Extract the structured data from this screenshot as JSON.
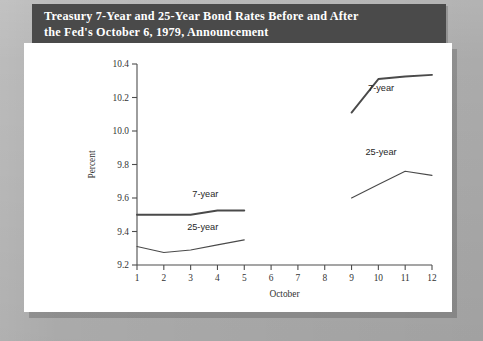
{
  "title": {
    "line1": "Treasury 7-Year and 25-Year Bond Rates Before and After",
    "line2": "the Fed's October 6, 1979, Announcement"
  },
  "colors": {
    "page_background": "#b4b4b4",
    "title_bar": "#4a4a4a",
    "title_text": "#ffffff",
    "panel": "#ffffff",
    "line": "#4a4a4a",
    "axis": "#4d4d4d"
  },
  "chart_data": {
    "type": "line",
    "title": "Treasury 7-Year and 25-Year Bond Rates Before and After the Fed's October 6, 1979, Announcement",
    "xlabel": "October",
    "ylabel": "Percent",
    "xlim": [
      1,
      12
    ],
    "ylim": [
      9.2,
      10.4
    ],
    "xticks": [
      1,
      2,
      3,
      4,
      5,
      6,
      7,
      8,
      9,
      10,
      11,
      12
    ],
    "xticklabels": [
      "1",
      "2",
      "3",
      "4",
      "5",
      "6",
      "7",
      "8",
      "9",
      "10",
      "11",
      "12"
    ],
    "yticks": [
      9.2,
      9.4,
      9.6,
      9.8,
      10.0,
      10.2,
      10.4
    ],
    "yticklabels": [
      "9.2",
      "9.4",
      "9.6",
      "9.8",
      "10.0",
      "10.2",
      "10.4"
    ],
    "grid": false,
    "legend": "annotations-inline",
    "series": [
      {
        "name": "7-year (before)",
        "label": "7-year",
        "x": [
          1,
          2,
          3,
          4,
          5
        ],
        "values": [
          9.5,
          9.5,
          9.5,
          9.525,
          9.525
        ],
        "linewidth": 1.9
      },
      {
        "name": "25-year (before)",
        "label": "25-year",
        "x": [
          1,
          2,
          3,
          4,
          5
        ],
        "values": [
          9.31,
          9.275,
          9.29,
          9.32,
          9.35
        ],
        "linewidth": 1.1
      },
      {
        "name": "7-year (after)",
        "label": "7-year",
        "x": [
          9,
          10,
          11,
          12
        ],
        "values": [
          10.11,
          10.31,
          10.325,
          10.335
        ],
        "linewidth": 1.9
      },
      {
        "name": "25-year (after)",
        "label": "25-year",
        "x": [
          9,
          10,
          11,
          12
        ],
        "values": [
          9.6,
          9.68,
          9.76,
          9.735
        ],
        "linewidth": 1.1
      }
    ],
    "annotations": [
      {
        "text": "7-year",
        "x": 3.55,
        "y": 9.605
      },
      {
        "text": "25-year",
        "x": 3.45,
        "y": 9.41
      },
      {
        "text": "7-year",
        "x": 10.1,
        "y": 10.24
      },
      {
        "text": "25-year",
        "x": 10.1,
        "y": 9.855
      }
    ]
  }
}
